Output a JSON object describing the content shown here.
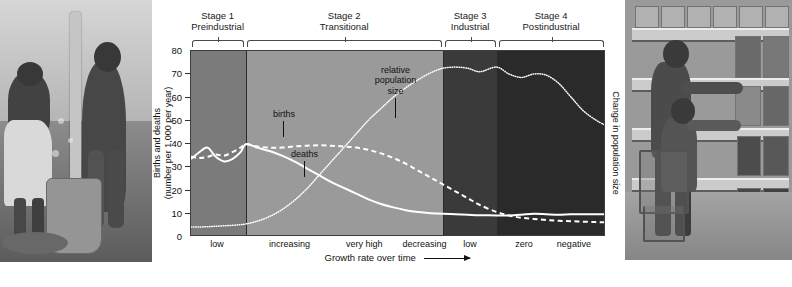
{
  "figure": {
    "left_photo_caption": "traditional-grain-pounding-photo",
    "right_photo_caption": "supermarket-shopping-photo"
  },
  "axes": {
    "y_title_line1": "Births and deaths",
    "y_title_line2": "(number per 1,000 per year)",
    "y_ticks": [
      "80",
      "70",
      "60",
      "50",
      "40",
      "30",
      "20",
      "10",
      "0"
    ],
    "y_min": 0,
    "y_max": 80,
    "x_title": "Growth rate over time",
    "x_arrow": "⟶",
    "right_title": "Change in population size"
  },
  "stages": [
    {
      "number": "Stage 1",
      "name": "Preindustrial",
      "start": 0,
      "end": 13.3,
      "shade": "#7b7b7b"
    },
    {
      "number": "Stage 2",
      "name": "Transitional",
      "start": 13.3,
      "end": 61.0,
      "shade": "#9a9a9a"
    },
    {
      "number": "Stage 3",
      "name": "Industrial",
      "start": 61.0,
      "end": 74.0,
      "shade": "#3a3a3a"
    },
    {
      "number": "Stage 4",
      "name": "Postindustrial",
      "start": 74.0,
      "end": 100,
      "shade": "#2a2a2a"
    }
  ],
  "x_categories": [
    {
      "label": "low",
      "center": 6.5
    },
    {
      "label": "increasing",
      "center": 24.0
    },
    {
      "label": "very high",
      "center": 42.0
    },
    {
      "label": "decreasing",
      "center": 56.5
    },
    {
      "label": "low",
      "center": 67.5
    },
    {
      "label": "zero",
      "center": 80.5
    },
    {
      "label": "negative",
      "center": 92.5
    }
  ],
  "annotations": [
    {
      "name": "births-label",
      "text": "births",
      "x": 22.5,
      "y_top": 25.0,
      "stem_len": 16
    },
    {
      "name": "deaths-label",
      "text": "deaths",
      "x": 27.5,
      "y_top": 42.5,
      "stem_len": 16
    },
    {
      "name": "population-label",
      "text": "relative\npopulation\nsize",
      "x": 49.5,
      "y_top": 6.0,
      "stem_len": 20
    }
  ],
  "chart_data": {
    "type": "line",
    "xlabel": "Growth rate over time",
    "ylabel": "Births and deaths (number per 1,000 per year)",
    "ylim": [
      0,
      80
    ],
    "xlim": [
      0,
      100
    ],
    "grid": false,
    "legend": "inline annotations",
    "right_axis_label": "Change in population size",
    "x": [
      0,
      2,
      4,
      6,
      8,
      10,
      12,
      13.3,
      16,
      19,
      22,
      25,
      28,
      31,
      34,
      37,
      40,
      43,
      46,
      49,
      52,
      55,
      58,
      61,
      64,
      67,
      70,
      74,
      77,
      80,
      83,
      86,
      89,
      92,
      95,
      98,
      100
    ],
    "series": [
      {
        "name": "births",
        "style": "dashed",
        "values": [
          34,
          33.5,
          34,
          35,
          34.5,
          36,
          38,
          39.5,
          38.5,
          38,
          38,
          38.5,
          38.8,
          39,
          38.8,
          38.5,
          38,
          37,
          35.5,
          33.5,
          31,
          28,
          25,
          22,
          19,
          16,
          13,
          10,
          8.5,
          7.5,
          7,
          6.5,
          6.2,
          6,
          5.8,
          5.6,
          5.5
        ]
      },
      {
        "name": "deaths",
        "style": "solid",
        "values": [
          33,
          36,
          38,
          34,
          32,
          33,
          36,
          39.5,
          38,
          36.5,
          34.5,
          32,
          29,
          26,
          23,
          20.5,
          18,
          15.5,
          13.5,
          12,
          10.8,
          10,
          9.5,
          9.2,
          9,
          8.8,
          8.6,
          8.5,
          8.5,
          8.8,
          9.2,
          9,
          8.8,
          9,
          9,
          9,
          9
        ]
      },
      {
        "name": "relative population size",
        "style": "dotted",
        "values": [
          3.5,
          3.5,
          3.6,
          3.8,
          4,
          4.2,
          4.5,
          4.8,
          6,
          8,
          11,
          15,
          20,
          26,
          32,
          38,
          44,
          50,
          55,
          60,
          64,
          67.5,
          70.5,
          72.5,
          73,
          72.5,
          71,
          73,
          70,
          68.5,
          70,
          69.5,
          66,
          60,
          54,
          50,
          48
        ]
      }
    ]
  }
}
